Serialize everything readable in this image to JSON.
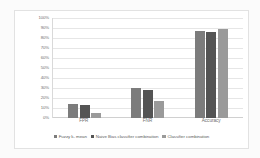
{
  "chart_data": {
    "type": "bar",
    "title": "",
    "xlabel": "",
    "ylabel": "",
    "ylim": [
      0,
      100
    ],
    "grid": true,
    "legend_position": "bottom",
    "categories": [
      "FPR",
      "FNR",
      "Accuracy"
    ],
    "y_ticks": [
      "0%",
      "10%",
      "20%",
      "30%",
      "40%",
      "50%",
      "60%",
      "70%",
      "80%",
      "90%",
      "100%"
    ],
    "series": [
      {
        "name": "Fuzzy k- mean",
        "color": "#7c7c7c",
        "values": [
          14,
          30,
          87
        ]
      },
      {
        "name": "Naive Bias classifier combination",
        "color": "#545454",
        "values": [
          13,
          28,
          86
        ]
      },
      {
        "name": "Classifier combination",
        "color": "#9a9a9a",
        "values": [
          5,
          17,
          89
        ]
      }
    ]
  }
}
